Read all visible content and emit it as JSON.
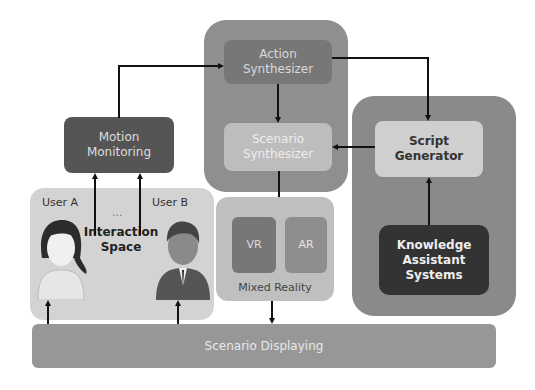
{
  "diagram": {
    "action_synthesizer": "Action Synthesizer",
    "scenario_synthesizer": "Scenario Synthesizer",
    "script_generator": "Script Generator",
    "knowledge_assistant": "Knowledge Assistant Systems",
    "motion_monitoring": "Motion Monitoring",
    "interaction_space": "Interaction Space",
    "user_a": "User A",
    "user_b": "User B",
    "ellipsis": "...",
    "vr": "VR",
    "ar": "AR",
    "mixed_reality": "Mixed Reality",
    "scenario_displaying": "Scenario Displaying"
  }
}
